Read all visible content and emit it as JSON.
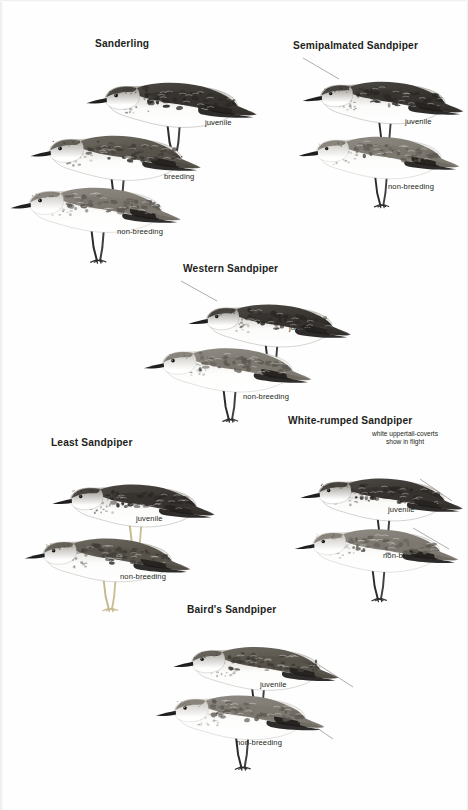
{
  "page": {
    "width": 468,
    "height": 810,
    "background": "#fefefe",
    "ink_color": "#231f20"
  },
  "species": [
    {
      "id": "sanderling",
      "heading": "Sanderling",
      "heading_x": 95,
      "heading_y": 38,
      "labels": [
        {
          "text": "juvenile",
          "x": 205,
          "y": 118
        },
        {
          "text": "breeding",
          "x": 164,
          "y": 172
        },
        {
          "text": "non-breeding",
          "x": 117,
          "y": 227
        }
      ],
      "birds": [
        {
          "plumage": "juvenile",
          "x": 82,
          "y": 55,
          "w": 178,
          "h": 105,
          "tone": "dark",
          "leg_color": "#2b2b2b",
          "bill_color": "#1f1f1f",
          "leader": null
        },
        {
          "plumage": "breeding",
          "x": 26,
          "y": 108,
          "w": 178,
          "h": 105,
          "tone": "medium",
          "leg_color": "#2b2b2b",
          "bill_color": "#1f1f1f",
          "leader": null
        },
        {
          "plumage": "non-breeding",
          "x": 6,
          "y": 160,
          "w": 178,
          "h": 105,
          "tone": "pale",
          "leg_color": "#2b2b2b",
          "bill_color": "#1f1f1f",
          "leader": null
        }
      ]
    },
    {
      "id": "semipalmated-sandpiper",
      "heading": "Semipalmated Sandpiper",
      "heading_x": 293,
      "heading_y": 40,
      "labels": [
        {
          "text": "juvenile",
          "x": 405,
          "y": 117
        },
        {
          "text": "non-breeding",
          "x": 388,
          "y": 182
        }
      ],
      "birds": [
        {
          "plumage": "juvenile",
          "x": 300,
          "y": 55,
          "w": 165,
          "h": 100,
          "tone": "dark",
          "leg_color": "#2b2b2b",
          "bill_color": "#1f1f1f",
          "leader": {
            "x1": 302,
            "y1": 57,
            "x2": 338,
            "y2": 78
          }
        },
        {
          "plumage": "non-breeding",
          "x": 296,
          "y": 110,
          "w": 165,
          "h": 100,
          "tone": "pale",
          "leg_color": "#2b2b2b",
          "bill_color": "#1f1f1f",
          "leader": null
        }
      ]
    },
    {
      "id": "western-sandpiper",
      "heading": "Western Sandpiper",
      "heading_x": 183,
      "heading_y": 263,
      "labels": [
        {
          "text": "juvenile",
          "x": 289,
          "y": 323
        },
        {
          "text": "non-breeding",
          "x": 243,
          "y": 392
        }
      ],
      "birds": [
        {
          "plumage": "juvenile",
          "x": 183,
          "y": 278,
          "w": 172,
          "h": 100,
          "tone": "dark",
          "leg_color": "#2b2b2b",
          "bill_color": "#1f1f1f",
          "leader": {
            "x1": 180,
            "y1": 280,
            "x2": 216,
            "y2": 300
          }
        },
        {
          "plumage": "non-breeding",
          "x": 141,
          "y": 320,
          "w": 172,
          "h": 105,
          "tone": "pale",
          "leg_color": "#2b2b2b",
          "bill_color": "#1f1f1f",
          "leader": null
        }
      ]
    },
    {
      "id": "least-sandpiper",
      "heading": "Least Sandpiper",
      "heading_x": 51,
      "heading_y": 437,
      "labels": [
        {
          "text": "juvenile",
          "x": 136,
          "y": 514
        },
        {
          "text": "non-breeding",
          "x": 120,
          "y": 572
        }
      ],
      "birds": [
        {
          "plumage": "juvenile",
          "x": 48,
          "y": 458,
          "w": 170,
          "h": 100,
          "tone": "dark",
          "leg_color": "#c7b98e",
          "bill_color": "#1f1f1f",
          "leader": null
        },
        {
          "plumage": "non-breeding",
          "x": 22,
          "y": 510,
          "w": 170,
          "h": 105,
          "tone": "medium",
          "leg_color": "#c7b98e",
          "bill_color": "#1f1f1f",
          "leader": null
        }
      ]
    },
    {
      "id": "white-rumped-sandpiper",
      "heading": "White-rumped Sandpiper",
      "heading_x": 288,
      "heading_y": 415,
      "labels": [
        {
          "text": "juvenile",
          "x": 388,
          "y": 505
        },
        {
          "text": "non-breeding",
          "x": 383,
          "y": 551
        }
      ],
      "annotations": [
        {
          "lines": [
            "white uppertail-coverts",
            "show in flight"
          ],
          "x": 372,
          "y": 430
        }
      ],
      "birds": [
        {
          "plumage": "juvenile",
          "x": 297,
          "y": 452,
          "w": 168,
          "h": 100,
          "tone": "dark",
          "leg_color": "#2b2b2b",
          "bill_color": "#1f1f1f",
          "leader": {
            "x1": 419,
            "y1": 478,
            "x2": 451,
            "y2": 500
          }
        },
        {
          "plumage": "non-breeding",
          "x": 292,
          "y": 502,
          "w": 168,
          "h": 102,
          "tone": "pale",
          "leg_color": "#2b2b2b",
          "bill_color": "#1f1f1f",
          "leader": {
            "x1": 412,
            "y1": 527,
            "x2": 448,
            "y2": 548
          }
        }
      ]
    },
    {
      "id": "bairds-sandpiper",
      "heading": "Baird's Sandpiper",
      "heading_x": 187,
      "heading_y": 604,
      "labels": [
        {
          "text": "juvenile",
          "x": 260,
          "y": 680
        },
        {
          "text": "non-breeding",
          "x": 236,
          "y": 738
        }
      ],
      "birds": [
        {
          "plumage": "juvenile",
          "x": 168,
          "y": 620,
          "w": 175,
          "h": 102,
          "tone": "medium",
          "leg_color": "#2b2b2b",
          "bill_color": "#1f1f1f",
          "leader": {
            "x1": 318,
            "y1": 664,
            "x2": 352,
            "y2": 686
          }
        },
        {
          "plumage": "non-breeding",
          "x": 152,
          "y": 668,
          "w": 175,
          "h": 104,
          "tone": "pale",
          "leg_color": "#2b2b2b",
          "bill_color": "#1f1f1f",
          "leader": {
            "x1": 300,
            "y1": 716,
            "x2": 332,
            "y2": 738
          }
        }
      ]
    }
  ]
}
